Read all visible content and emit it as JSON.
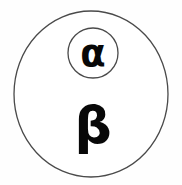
{
  "diagram": {
    "type": "nested-set-diagram",
    "background_color": "#fefefe",
    "stroke_color": "#4a4a4a",
    "label_color": "#080808",
    "outer_set": {
      "name": "outer-region",
      "label": "β",
      "label_name": "beta",
      "shape": "ellipse",
      "center_x": 91,
      "center_y": 94,
      "radius_x": 77,
      "radius_y": 83,
      "fill": "#ffffff",
      "stroke_width": 1.3
    },
    "inner_set": {
      "name": "inner-region",
      "label": "α",
      "label_name": "alpha",
      "shape": "ellipse",
      "center_x": 93,
      "center_y": 53,
      "radius_x": 25,
      "radius_y": 25,
      "fill": "#ffffff",
      "stroke_width": 1.3
    },
    "labels": [
      {
        "text": "α",
        "name": "alpha",
        "x": 93,
        "y": 66,
        "font_size": 37
      },
      {
        "text": "β",
        "name": "beta",
        "x": 93,
        "y": 143,
        "font_size": 52
      }
    ]
  }
}
